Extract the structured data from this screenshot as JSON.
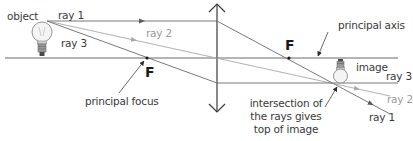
{
  "diagram": {
    "labels": {
      "object": "object",
      "image": "image",
      "ray1_start": "ray 1",
      "ray2_start": "ray 2",
      "ray3_start": "ray 3",
      "ray1_end": "ray 1",
      "ray2_end": "ray 2",
      "ray3_end": "ray 3",
      "focus_left": "F",
      "focus_right": "F",
      "principal_axis": "principal axis",
      "principal_focus": "principal focus",
      "intersection_line1": "intersection of",
      "intersection_line2": "the rays gives",
      "intersection_line3": "top of image"
    },
    "colors": {
      "ray_dark": "#5a5a5a",
      "ray_light": "#a8a8a8",
      "axis": "#6a6a6a",
      "lens": "#3a3a3a",
      "text": "#3a3a3a",
      "text_light": "#9a9a9a"
    },
    "geometry": {
      "axis_y": 58,
      "lens_x": 217,
      "focus_left_x": 147,
      "focus_right_x": 289,
      "object_top": [
        47,
        21
      ],
      "image_top": [
        340,
        83
      ]
    }
  }
}
